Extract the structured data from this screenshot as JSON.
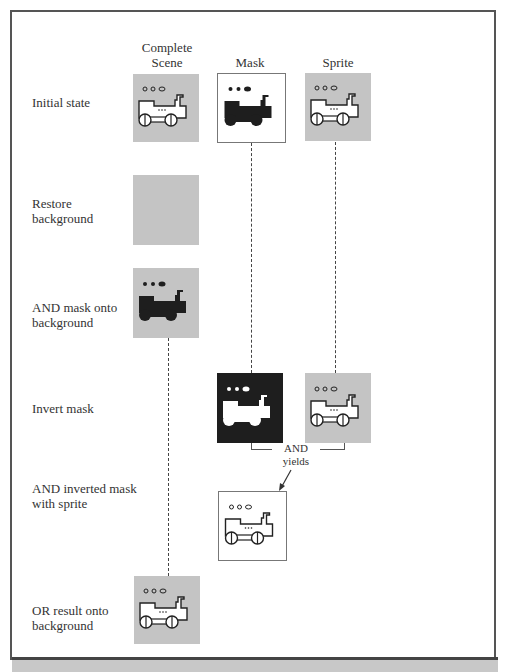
{
  "columns": {
    "complete_scene": "Complete\nScene",
    "complete_scene_l1": "Complete",
    "complete_scene_l2": "Scene",
    "mask": "Mask",
    "sprite": "Sprite"
  },
  "rows": [
    {
      "label_l1": "Initial state",
      "label_l2": ""
    },
    {
      "label_l1": "Restore",
      "label_l2": "background"
    },
    {
      "label_l1": "AND mask onto",
      "label_l2": "background"
    },
    {
      "label_l1": "Invert mask",
      "label_l2": ""
    },
    {
      "label_l1": "AND inverted mask",
      "label_l2": "with sprite"
    },
    {
      "label_l1": "OR result onto",
      "label_l2": "background"
    }
  ],
  "operation": {
    "l1": "AND",
    "l2": "yields"
  },
  "colors": {
    "background_gray": "#c4c4c4",
    "mask_black": "#1e1e1e",
    "white": "#ffffff",
    "frame": "#555555"
  },
  "icons": {
    "sprite": "locomotive-icon"
  }
}
